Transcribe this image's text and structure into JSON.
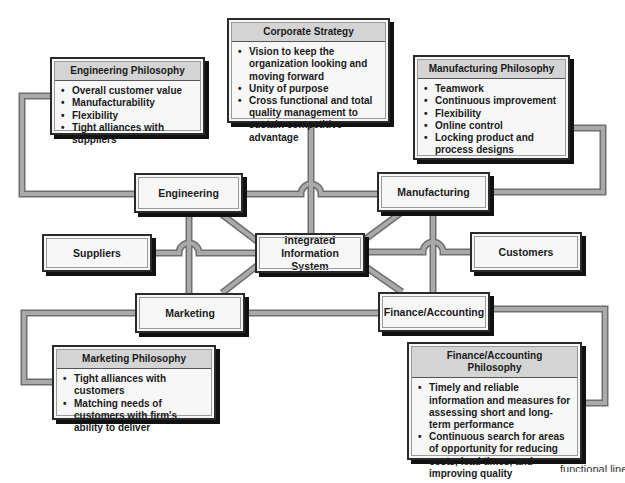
{
  "diagram": {
    "center_node": {
      "label": "Integrated Information System"
    },
    "functional_nodes": {
      "engineering": "Engineering",
      "manufacturing": "Manufacturing",
      "marketing": "Marketing",
      "finance": "Finance/Accounting",
      "suppliers": "Suppliers",
      "customers": "Customers"
    },
    "philosophies": {
      "corporate": {
        "title": "Corporate Strategy",
        "items": [
          "Vision to keep the organization looking and moving forward",
          "Unity of purpose",
          "Cross functional and total quality management to sustain competitive advantage"
        ]
      },
      "engineering": {
        "title": "Engineering Philosophy",
        "items": [
          "Overall customer value",
          "Manufacturability",
          "Flexibility",
          "Tight alliances with suppliers"
        ]
      },
      "manufacturing": {
        "title": "Manufacturing Philosophy",
        "items": [
          "Teamwork",
          "Continuous improvement",
          "Flexibility",
          "Online control",
          "Locking product and process designs"
        ]
      },
      "marketing": {
        "title": "Marketing Philosophy",
        "items": [
          "Tight alliances with customers",
          "Matching needs of customers with firm's ability to deliver"
        ]
      },
      "finance": {
        "title": "Finance/Accounting Philosophy",
        "items": [
          "Timely and reliable information and measures for assessing short and long-term performance",
          "Continuous search for areas of opportunity for reducing costs, lead times, and improving quality"
        ]
      }
    },
    "caption_partial": "functional lines"
  },
  "colors": {
    "connector": "#9a9a9a",
    "connector_edge": "#6e6e6e",
    "box_fill": "#f7f7f7",
    "header_fill": "#d4d4d4",
    "shadow": "#111111"
  }
}
